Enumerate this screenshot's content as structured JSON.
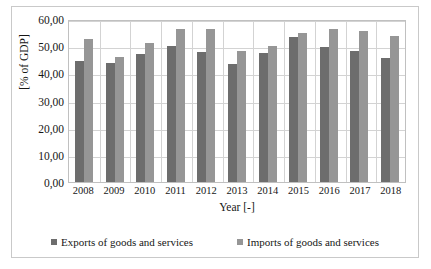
{
  "chart_data": {
    "type": "bar",
    "title": "",
    "xlabel": "Year [-]",
    "ylabel": "[% of GDP]",
    "categories": [
      "2008",
      "2009",
      "2010",
      "2011",
      "2012",
      "2013",
      "2014",
      "2015",
      "2016",
      "2017",
      "2018"
    ],
    "series": [
      {
        "name": "Exports of goods and services",
        "color": "#6d6d6d",
        "values": [
          44.6,
          43.8,
          47.1,
          50.0,
          48.0,
          43.3,
          47.5,
          53.4,
          49.7,
          48.2,
          45.5
        ]
      },
      {
        "name": "Imports of goods and services",
        "color": "#969696",
        "values": [
          52.7,
          45.9,
          51.2,
          56.5,
          56.4,
          48.3,
          50.2,
          54.9,
          56.2,
          55.6,
          53.7
        ]
      }
    ],
    "ylim": [
      0,
      60
    ],
    "yticks": [
      "0,00",
      "10,00",
      "20,00",
      "30,00",
      "40,00",
      "50,00",
      "60,00"
    ],
    "ytick_values": [
      0,
      10,
      20,
      30,
      40,
      50,
      60
    ],
    "grid": "horizontal-and-vertical",
    "legend_position": "bottom",
    "decimal_separator": ","
  }
}
